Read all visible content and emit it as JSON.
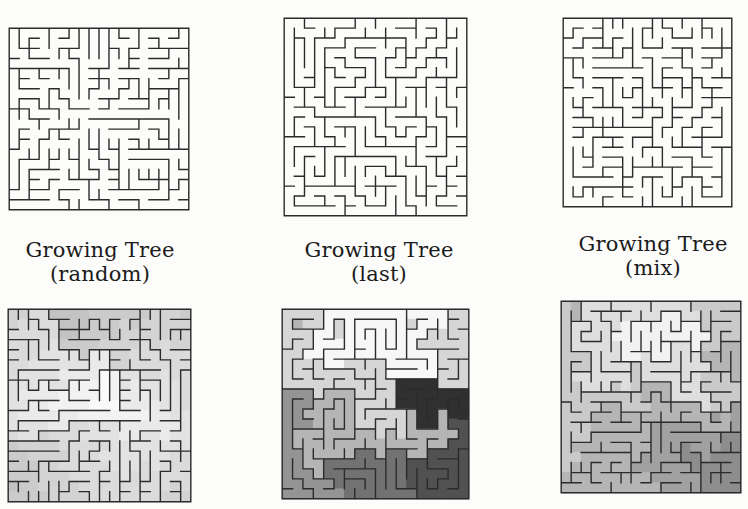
{
  "page": {
    "background": "#fcfcfa",
    "text_color": "#1b1b1b",
    "wall_color": "#2b2b2b"
  },
  "figure": {
    "columns": [
      {
        "id": "random",
        "caption": {
          "line1": "Growing Tree",
          "line2": "(random)"
        },
        "plain_maze": {
          "cols": 18,
          "rows": 18,
          "seed": 14,
          "mode": "random"
        },
        "shaded_maze": {
          "cols": 18,
          "rows": 19,
          "seed": 31,
          "mode": "random",
          "shade": {
            "start_col": 9,
            "start_row": 6,
            "from": "#fafafa",
            "to": "#c3c3c3",
            "levels": 8
          }
        }
      },
      {
        "id": "last",
        "caption": {
          "line1": "Growing Tree",
          "line2": "(last)"
        },
        "plain_maze": {
          "cols": 18,
          "rows": 20,
          "seed": 8,
          "mode": "last"
        },
        "shaded_maze": {
          "cols": 18,
          "rows": 19,
          "seed": 58,
          "mode": "last",
          "shade": {
            "start_col": 8,
            "start_row": 1,
            "from": "#f7f7f7",
            "to": "#303030",
            "levels": 7
          }
        }
      },
      {
        "id": "mix",
        "caption": {
          "line1": "Growing Tree",
          "line2": "(mix)"
        },
        "plain_maze": {
          "cols": 17,
          "rows": 19,
          "seed": 77,
          "mode": "mix"
        },
        "shaded_maze": {
          "cols": 18,
          "rows": 19,
          "seed": 91,
          "mode": "mix",
          "shade": {
            "start_col": 11,
            "start_row": 3,
            "from": "#f2f2f2",
            "to": "#8d8d8d",
            "levels": 6
          }
        }
      }
    ]
  }
}
